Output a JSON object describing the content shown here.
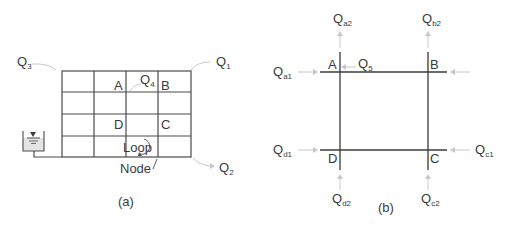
{
  "figure_a": {
    "caption": "(a)",
    "flows": {
      "q3": {
        "main": "Q",
        "sub": "3"
      },
      "q1": {
        "main": "Q",
        "sub": "1"
      },
      "q4": {
        "main": "Q",
        "sub": "4"
      },
      "q2": {
        "main": "Q",
        "sub": "2"
      }
    },
    "nodes": {
      "a": "A",
      "b": "B",
      "c": "C",
      "d": "D"
    },
    "loop_label": "Loop",
    "node_label": "Node",
    "grid": {
      "rows": 4,
      "cols": 4
    }
  },
  "figure_b": {
    "caption": "(b)",
    "nodes": {
      "a": "A",
      "b": "B",
      "c": "C",
      "d": "D"
    },
    "flows": {
      "qa2": {
        "main": "Q",
        "sub": "a2"
      },
      "qb2": {
        "main": "Q",
        "sub": "b2"
      },
      "qa1": {
        "main": "Q",
        "sub": "a1"
      },
      "q5": {
        "main": "Q",
        "sub": "5"
      },
      "qd1": {
        "main": "Q",
        "sub": "d1"
      },
      "qc1": {
        "main": "Q",
        "sub": "c1"
      },
      "qd2": {
        "main": "Q",
        "sub": "d2"
      },
      "qc2": {
        "main": "Q",
        "sub": "c2"
      }
    }
  }
}
